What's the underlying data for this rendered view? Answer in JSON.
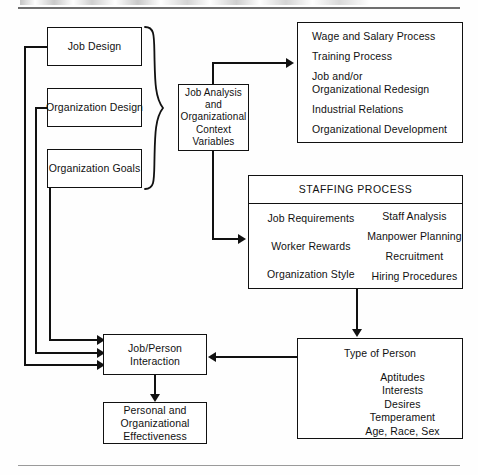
{
  "page": {
    "title_fragment": "",
    "has_top_rule": true,
    "has_bottom_rule": true
  },
  "diagram": {
    "type": "flowchart",
    "boxes": {
      "job_design": {
        "label": "Job Design"
      },
      "organization_design": {
        "label": "Organization Design"
      },
      "organization_goals": {
        "label": "Organization Goals"
      },
      "job_analysis": {
        "lines": [
          "Job Analysis",
          "and",
          "Organizational",
          "Context",
          "Variables"
        ]
      },
      "hr_processes": {
        "items": [
          "Wage and Salary Process",
          "Training Process",
          "Job and/or",
          "Organizational Redesign",
          "Industrial Relations",
          "Organizational Development"
        ]
      },
      "staffing_process": {
        "title": "STAFFING PROCESS",
        "inputs": [
          "Job Requirements",
          "Worker Rewards",
          "Organization Style"
        ],
        "outputs": [
          "Staff Analysis",
          "Manpower Planning",
          "Recruitment",
          "Hiring Procedures"
        ]
      },
      "type_of_person": {
        "title": "Type of Person",
        "items": [
          "Aptitudes",
          "Interests",
          "Desires",
          "Temperament",
          "Age, Race, Sex"
        ]
      },
      "job_person_interaction": {
        "lines": [
          "Job/Person",
          "Interaction"
        ]
      },
      "effectiveness": {
        "lines": [
          "Personal and",
          "Organizational",
          "Effectiveness"
        ]
      }
    },
    "colors": {
      "stroke": "#111111",
      "background": "#fefefe",
      "rule": "#8d8d8d"
    }
  }
}
